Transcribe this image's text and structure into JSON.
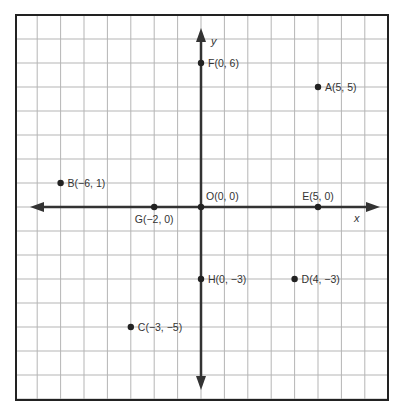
{
  "chart_data": {
    "type": "scatter",
    "title": "",
    "xlabel": "x",
    "ylabel": "y",
    "xlim": [
      -8,
      7
    ],
    "ylim": [
      -8,
      8
    ],
    "grid": true,
    "legend": null,
    "origin_label": "O(0, 0)",
    "points": [
      {
        "name": "A",
        "x": 5,
        "y": 5,
        "label": "A(5, 5)",
        "label_pos": "right"
      },
      {
        "name": "B",
        "x": -6,
        "y": 1,
        "label": "B(−6, 1)",
        "label_pos": "right"
      },
      {
        "name": "C",
        "x": -3,
        "y": -5,
        "label": "C(−3, −5)",
        "label_pos": "right"
      },
      {
        "name": "D",
        "x": 4,
        "y": -3,
        "label": "D(4, −3)",
        "label_pos": "right"
      },
      {
        "name": "E",
        "x": 5,
        "y": 0,
        "label": "E(5, 0)",
        "label_pos": "above"
      },
      {
        "name": "F",
        "x": 0,
        "y": 6,
        "label": "F(0, 6)",
        "label_pos": "right"
      },
      {
        "name": "G",
        "x": -2,
        "y": 0,
        "label": "G(−2, 0)",
        "label_pos": "below"
      },
      {
        "name": "H",
        "x": 0,
        "y": -3,
        "label": "H(0, −3)",
        "label_pos": "right"
      },
      {
        "name": "O",
        "x": 0,
        "y": 0,
        "label": "O(0, 0)",
        "label_pos": "above-right"
      }
    ]
  },
  "colors": {
    "grid": "#b5b5b5",
    "border": "#222222",
    "axis": "#333333",
    "point": "#222222",
    "text": "#333333"
  },
  "axes": {
    "x_label": "x",
    "y_label": "y"
  }
}
